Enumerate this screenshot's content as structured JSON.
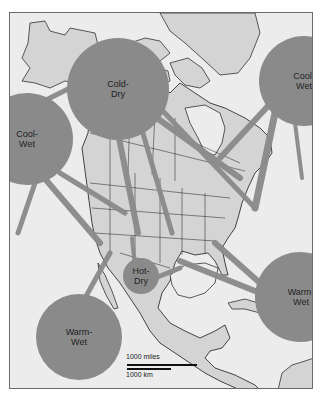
{
  "colors": {
    "ocean": "#ececec",
    "land": "#d4d4d4",
    "air_mass": "#8a8a8a",
    "outline": "#1a1a1a",
    "frame": "#6a6a6a"
  },
  "air_masses": [
    {
      "id": "cold-dry",
      "label": "Cold-\nDry",
      "cx": 108,
      "cy": 76,
      "r": 51
    },
    {
      "id": "cool-wet-pacific",
      "label": "Cool-\nWet",
      "cx": 17,
      "cy": 126,
      "r": 46
    },
    {
      "id": "cool-wet-atlantic",
      "label": "Cool-\nWet",
      "cx": 294,
      "cy": 68,
      "r": 45
    },
    {
      "id": "hot-dry",
      "label": "Hot-\nDry",
      "cx": 131,
      "cy": 263,
      "r": 18
    },
    {
      "id": "warm-wet-atlantic",
      "label": "Warm-\nWet",
      "cx": 290,
      "cy": 284,
      "r": 45
    },
    {
      "id": "warm-wet-pacific",
      "label": "Warm-\nWet",
      "cx": 69,
      "cy": 324,
      "r": 43
    }
  ],
  "scale": {
    "miles_label": "1000 miles",
    "km_label": "1000 km"
  }
}
